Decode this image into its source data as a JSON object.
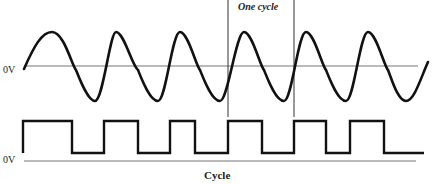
{
  "diagram": {
    "sine_wave": {
      "zero_label": "0V",
      "cycles_shown": 6,
      "period_px": 64
    },
    "square_wave": {
      "zero_label": "0V",
      "pulses": 6
    },
    "annotations": {
      "one_cycle": "One cycle",
      "cycle_caption": "Cycle"
    },
    "colors": {
      "wave": "#111111",
      "axis": "#777777",
      "background": "#ffffff"
    }
  }
}
